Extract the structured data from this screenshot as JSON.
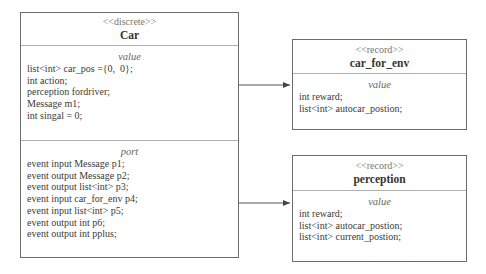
{
  "diagram": {
    "car": {
      "stereotype": "<<discrete>>",
      "name": "Car",
      "value_section": {
        "title": "value",
        "lines": [
          "list<int> car_pos ={0,  0};",
          "int action;",
          "perception fordriver;",
          "Message m1;",
          "int singal = 0;"
        ]
      },
      "port_section": {
        "title": "port",
        "lines": [
          "event input Message p1;",
          "event output Message p2;",
          "event output list<int> p3;",
          "event input car_for_env p4;",
          "event input list<int> p5;",
          "event output int p6;",
          "event output int pplus;"
        ]
      }
    },
    "car_for_env": {
      "stereotype": "<<record>>",
      "name": "car_for_env",
      "value_section": {
        "title": "value",
        "lines": [
          "int reward;",
          "list<int> autocar_postion;"
        ]
      }
    },
    "perception": {
      "stereotype": "<<record>>",
      "name": "perception",
      "value_section": {
        "title": "value",
        "lines": [
          "int reward;",
          "list<int> autocar_postion;",
          "list<int> current_postion;"
        ]
      }
    },
    "connectors": [
      {
        "from": "Car",
        "to": "car_for_env",
        "type": "arrow"
      },
      {
        "from": "Car",
        "to": "perception",
        "type": "arrow"
      }
    ],
    "colors": {
      "border": "#6b6b6b",
      "separator": "#b0b0b0",
      "text": "#333333",
      "stereotype": "#777777"
    }
  }
}
